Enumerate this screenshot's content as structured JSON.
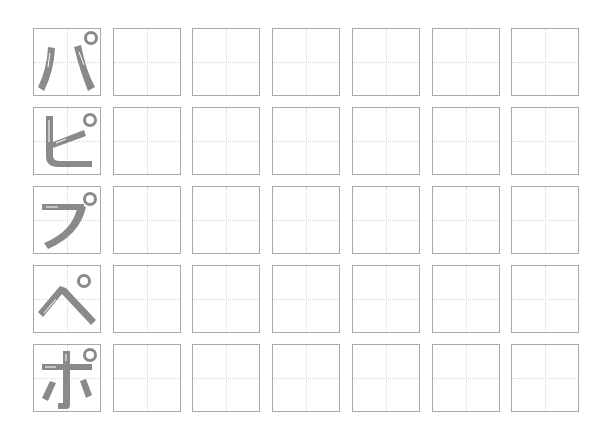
{
  "worksheet": {
    "title_ghost": "",
    "columns": 7,
    "rows": [
      {
        "character": "パ",
        "romaji": "pa",
        "practice_boxes": 6
      },
      {
        "character": "ピ",
        "romaji": "pi",
        "practice_boxes": 6
      },
      {
        "character": "プ",
        "romaji": "pu",
        "practice_boxes": 6
      },
      {
        "character": "ペ",
        "romaji": "pe",
        "practice_boxes": 6
      },
      {
        "character": "ポ",
        "romaji": "po",
        "practice_boxes": 6
      }
    ],
    "colors": {
      "box_border": "#a9a9a9",
      "guide_line": "#d6d6d6",
      "stroke": "#8a8a8a",
      "arrow": "#ffffff"
    }
  }
}
